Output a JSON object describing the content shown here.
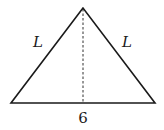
{
  "diagram": {
    "type": "isosceles-triangle",
    "colors": {
      "stroke": "#1a1a1a",
      "background": "#ffffff"
    },
    "vertices": {
      "apex": [
        83,
        8
      ],
      "base_left": [
        11,
        103
      ],
      "base_right": [
        155,
        103
      ]
    },
    "altitude": {
      "style": "dashed",
      "from": [
        83,
        8
      ],
      "to": [
        83,
        103
      ]
    },
    "labels": {
      "left_side": "L",
      "right_side": "L",
      "base": "6"
    }
  }
}
